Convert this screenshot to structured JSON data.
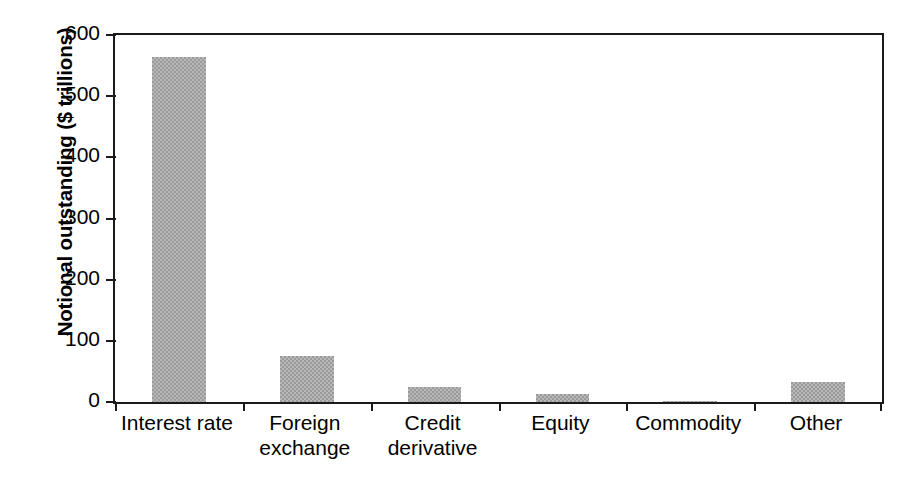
{
  "chart_data": {
    "type": "bar",
    "title": "",
    "subtitle": "",
    "xlabel": "",
    "ylabel": "Notional outstanding ($ trillions)",
    "categories": [
      "Interest rate",
      "Foreign\nexchange",
      "Credit\nderivative",
      "Equity",
      "Commodity",
      "Other"
    ],
    "values": [
      564,
      75,
      24,
      13,
      2,
      33
    ],
    "ylim": [
      0,
      600
    ],
    "yticks": [
      0,
      100,
      200,
      300,
      400,
      500,
      600
    ],
    "ytick_labels": [
      "0",
      "100",
      "200",
      "300",
      "400",
      "500",
      "600"
    ],
    "grid": false,
    "legend": false,
    "legend_position": "none",
    "bar_color": "#9a9a9a",
    "axis_color": "#1a1a1a",
    "background_color": "#ffffff"
  }
}
